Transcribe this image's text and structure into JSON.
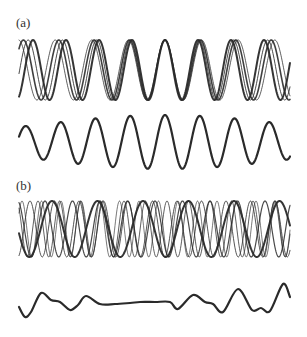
{
  "figure": {
    "width": 307,
    "height": 337,
    "line_color": "#2a2a2a",
    "panels": [
      {
        "id": "a",
        "label": "(a)",
        "description": "Component waves of nearly equal frequency aligned in phase at the centre",
        "components": {
          "center_y": 70,
          "amplitude": 30,
          "x_start": 19,
          "x_end": 290,
          "phase_align_x": 165,
          "waves": [
            {
              "period": 33.0,
              "stroke_width": 2.0,
              "opacity": 0.95
            },
            {
              "period": 34.2,
              "stroke_width": 1.0,
              "opacity": 0.85
            },
            {
              "period": 35.4,
              "stroke_width": 1.6,
              "opacity": 0.9
            },
            {
              "period": 36.6,
              "stroke_width": 1.0,
              "opacity": 0.75
            }
          ]
        },
        "sum": {
          "center_y": 142,
          "x_start": 19,
          "x_end": 290,
          "period": 34.8,
          "phase_align_x": 165,
          "amp_center": 27,
          "amp_edge": 16,
          "stroke_width": 2.2
        }
      },
      {
        "id": "b",
        "label": "(b)",
        "description": "Component waves of differing frequency with random phases",
        "components": {
          "center_y": 229,
          "amplitude": 28,
          "x_start": 19,
          "x_end": 290,
          "waves": [
            {
              "period": 45.5,
              "phase_x": 52,
              "stroke_width": 2.0,
              "opacity": 0.95
            },
            {
              "period": 24.5,
              "phase_x": 30,
              "stroke_width": 1.0,
              "opacity": 0.8
            },
            {
              "period": 21.5,
              "phase_x": 38,
              "stroke_width": 1.0,
              "opacity": 0.75
            },
            {
              "period": 27.5,
              "phase_x": 45,
              "stroke_width": 1.2,
              "opacity": 0.85
            },
            {
              "period": 19.5,
              "phase_x": 22,
              "stroke_width": 0.9,
              "opacity": 0.7
            }
          ]
        },
        "sum": {
          "stroke_width": 2.2,
          "points": [
            [
              19,
              307
            ],
            [
              25,
              317
            ],
            [
              31,
              312
            ],
            [
              41,
              293
            ],
            [
              51,
              300
            ],
            [
              60,
              302
            ],
            [
              70,
              310
            ],
            [
              78,
              305
            ],
            [
              86,
              296
            ],
            [
              100,
              304
            ],
            [
              115,
              304
            ],
            [
              130,
              303
            ],
            [
              140,
              302
            ],
            [
              155,
              302
            ],
            [
              170,
              302
            ],
            [
              178,
              309
            ],
            [
              193,
              295
            ],
            [
              205,
              302
            ],
            [
              213,
              304
            ],
            [
              223,
              312
            ],
            [
              238,
              289
            ],
            [
              252,
              310
            ],
            [
              261,
              308
            ],
            [
              270,
              311
            ],
            [
              283,
              284
            ],
            [
              290,
              297
            ]
          ]
        }
      }
    ]
  }
}
